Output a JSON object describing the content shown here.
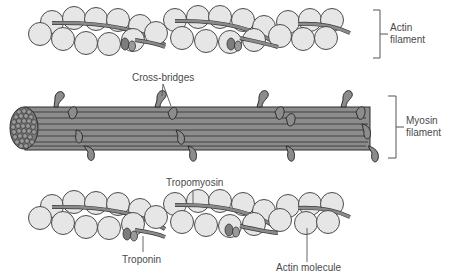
{
  "figure": {
    "panels": [
      {
        "id": "actin-filament-top",
        "bracket_label_line1": "Actin",
        "bracket_label_line2": "filament"
      },
      {
        "id": "myosin-filament",
        "callout": "Cross-bridges",
        "bracket_label_line1": "Myosin",
        "bracket_label_line2": "filament"
      },
      {
        "id": "actin-filament-detail",
        "callouts": {
          "tropomyosin": "Tropomyosin",
          "troponin": "Troponin",
          "actin_molecule": "Actin molecule"
        }
      }
    ],
    "colors": {
      "actin_sphere_fill": "#e6e6e6",
      "actin_sphere_stroke": "#3a3a3a",
      "tropomyosin_fill": "#8a8a8a",
      "troponin_fill": "#7d7d7d",
      "myosin_fill": "#8c8c8c",
      "myosin_stroke": "#2e2e2e",
      "label_text": "#4a4a4a",
      "leader_line": "#555555"
    }
  }
}
